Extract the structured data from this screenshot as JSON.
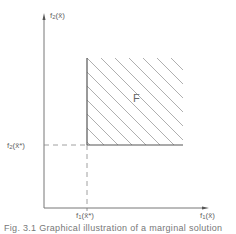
{
  "diagram": {
    "type": "objective-space plot",
    "axes": {
      "x_label_func": "f",
      "x_label_sub": "1",
      "x_label_arg": "(x̄)",
      "y_label_func": "f",
      "y_label_sub": "2",
      "y_label_arg": "(x̄)"
    },
    "reference_point": {
      "x_label_func": "f",
      "x_label_sub": "1",
      "x_label_arg": "(x̄*)",
      "y_label_func": "f",
      "y_label_sub": "2",
      "y_label_arg": "(x̄*)"
    },
    "region": {
      "label": "F",
      "fill": "diagonal hatching"
    },
    "colors": {
      "axis": "#777777",
      "boundary": "#555555",
      "hatch": "#999999",
      "dash": "#888888"
    }
  },
  "caption": "Fig. 3.1   Graphical illustration of a marginal solution"
}
